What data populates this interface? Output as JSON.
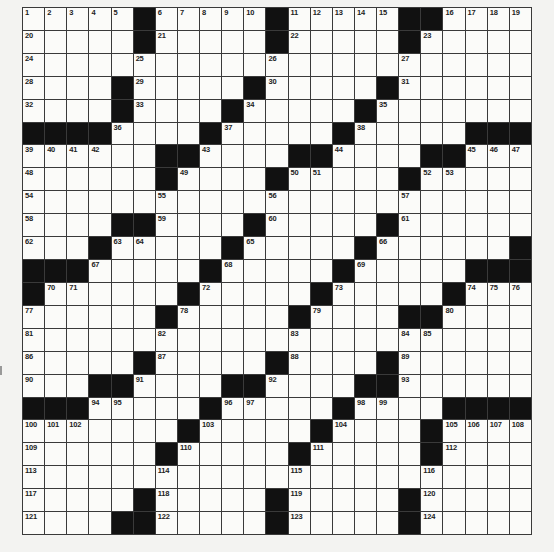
{
  "puzzle": {
    "rows": 23,
    "cols": 23,
    "colors": {
      "black": "#111111",
      "white": "#fbfbf9",
      "line": "#3a3a3a",
      "background": "#f3f3f1"
    },
    "grid": [
      ".....#.....#.....##....",
      ".....#.....#.....#.....",
      ".......................",
      "....#.....#.....#......",
      "....#....#.....#.......",
      "####....#.....#.....###",
      "......##....##....##...",
      "......#....#.....#.....",
      ".......................",
      "....##....#.....#......",
      "...#.....#.....#......#",
      "###.....#.....#.....###",
      "#......#.....#.....#...",
      "......#.....#....##....",
      ".......................",
      ".....#.....#....#......",
      "...##....##....##......",
      "###.....#.....#....####",
      ".......#.....#....#....",
      "......#.....#.....#....",
      ".......................",
      ".....#.....#.....#.....",
      "....##.....#.....#....."
    ],
    "numbers": [
      [
        0,
        0,
        1
      ],
      [
        0,
        1,
        2
      ],
      [
        0,
        2,
        3
      ],
      [
        0,
        3,
        4
      ],
      [
        0,
        4,
        5
      ],
      [
        0,
        6,
        6
      ],
      [
        0,
        7,
        7
      ],
      [
        0,
        8,
        8
      ],
      [
        0,
        9,
        9
      ],
      [
        0,
        10,
        10
      ],
      [
        0,
        12,
        11
      ],
      [
        0,
        13,
        12
      ],
      [
        0,
        14,
        13
      ],
      [
        0,
        15,
        14
      ],
      [
        0,
        16,
        15
      ],
      [
        0,
        19,
        16
      ],
      [
        0,
        20,
        17
      ],
      [
        0,
        21,
        18
      ],
      [
        0,
        22,
        19
      ],
      [
        1,
        0,
        20
      ],
      [
        1,
        6,
        21
      ],
      [
        1,
        12,
        22
      ],
      [
        1,
        18,
        23
      ],
      [
        2,
        0,
        24
      ],
      [
        2,
        5,
        25
      ],
      [
        2,
        11,
        26
      ],
      [
        2,
        17,
        27
      ],
      [
        3,
        0,
        28
      ],
      [
        3,
        5,
        29
      ],
      [
        3,
        11,
        30
      ],
      [
        3,
        17,
        31
      ],
      [
        4,
        0,
        32
      ],
      [
        4,
        5,
        33
      ],
      [
        4,
        10,
        34
      ],
      [
        4,
        16,
        35
      ],
      [
        5,
        4,
        36
      ],
      [
        5,
        9,
        37
      ],
      [
        5,
        15,
        38
      ],
      [
        6,
        0,
        39
      ],
      [
        6,
        1,
        40
      ],
      [
        6,
        2,
        41
      ],
      [
        6,
        3,
        42
      ],
      [
        6,
        8,
        43
      ],
      [
        6,
        14,
        44
      ],
      [
        6,
        20,
        45
      ],
      [
        6,
        21,
        46
      ],
      [
        6,
        22,
        47
      ],
      [
        7,
        0,
        48
      ],
      [
        7,
        7,
        49
      ],
      [
        7,
        12,
        50
      ],
      [
        7,
        13,
        51
      ],
      [
        7,
        18,
        52
      ],
      [
        7,
        19,
        53
      ],
      [
        8,
        0,
        54
      ],
      [
        8,
        6,
        55
      ],
      [
        8,
        11,
        56
      ],
      [
        8,
        17,
        57
      ],
      [
        9,
        0,
        58
      ],
      [
        9,
        6,
        59
      ],
      [
        9,
        11,
        60
      ],
      [
        9,
        17,
        61
      ],
      [
        10,
        0,
        62
      ],
      [
        10,
        4,
        63
      ],
      [
        10,
        5,
        64
      ],
      [
        10,
        10,
        65
      ],
      [
        10,
        16,
        66
      ],
      [
        11,
        3,
        67
      ],
      [
        11,
        9,
        68
      ],
      [
        11,
        15,
        69
      ],
      [
        12,
        1,
        70
      ],
      [
        12,
        2,
        71
      ],
      [
        12,
        8,
        72
      ],
      [
        12,
        14,
        73
      ],
      [
        12,
        20,
        74
      ],
      [
        12,
        21,
        75
      ],
      [
        12,
        22,
        76
      ],
      [
        13,
        0,
        77
      ],
      [
        13,
        7,
        78
      ],
      [
        13,
        13,
        79
      ],
      [
        13,
        19,
        80
      ],
      [
        14,
        0,
        81
      ],
      [
        14,
        6,
        82
      ],
      [
        14,
        12,
        83
      ],
      [
        14,
        17,
        84
      ],
      [
        14,
        18,
        85
      ],
      [
        15,
        0,
        86
      ],
      [
        15,
        6,
        87
      ],
      [
        15,
        12,
        88
      ],
      [
        15,
        17,
        89
      ],
      [
        16,
        0,
        90
      ],
      [
        16,
        5,
        91
      ],
      [
        16,
        11,
        92
      ],
      [
        16,
        17,
        93
      ],
      [
        17,
        3,
        94
      ],
      [
        17,
        4,
        95
      ],
      [
        17,
        9,
        96
      ],
      [
        17,
        10,
        97
      ],
      [
        17,
        15,
        98
      ],
      [
        17,
        16,
        99
      ],
      [
        18,
        0,
        100
      ],
      [
        18,
        1,
        101
      ],
      [
        18,
        2,
        102
      ],
      [
        18,
        8,
        103
      ],
      [
        18,
        14,
        104
      ],
      [
        18,
        19,
        105
      ],
      [
        18,
        20,
        106
      ],
      [
        18,
        21,
        107
      ],
      [
        18,
        22,
        108
      ],
      [
        19,
        0,
        109
      ],
      [
        19,
        7,
        110
      ],
      [
        19,
        13,
        111
      ],
      [
        19,
        19,
        112
      ],
      [
        20,
        0,
        113
      ],
      [
        20,
        6,
        114
      ],
      [
        20,
        12,
        115
      ],
      [
        20,
        18,
        116
      ],
      [
        21,
        0,
        117
      ],
      [
        21,
        6,
        118
      ],
      [
        21,
        12,
        119
      ],
      [
        21,
        18,
        120
      ],
      [
        22,
        0,
        121
      ],
      [
        22,
        6,
        122
      ],
      [
        22,
        12,
        123
      ],
      [
        22,
        18,
        124
      ]
    ]
  }
}
